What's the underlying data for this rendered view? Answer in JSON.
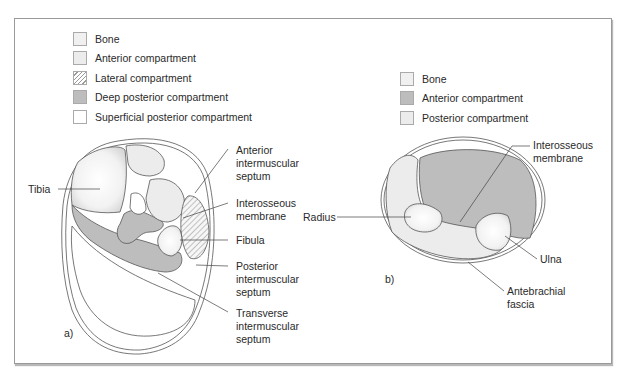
{
  "colors": {
    "bone": "#f4f4f4",
    "light": "#ededed",
    "deep": "#bdbdbd",
    "white": "#ffffff",
    "line": "#555555"
  },
  "panel_a": {
    "legend": [
      {
        "label": "Bone",
        "swatch": "bone"
      },
      {
        "label": "Anterior compartment",
        "swatch": "light"
      },
      {
        "label": "Lateral compartment",
        "swatch": "hatch"
      },
      {
        "label": "Deep posterior compartment",
        "swatch": "deep"
      },
      {
        "label": "Superficial posterior compartment",
        "swatch": "white"
      }
    ],
    "letter": "a)",
    "labels": {
      "tibia": "Tibia",
      "anterior_septum": "Anterior\nintermuscular\nseptum",
      "interosseous": "Interosseous\nmembrane",
      "fibula": "Fibula",
      "posterior_septum": "Posterior\nintermuscular\nseptum",
      "transverse_septum": "Transverse\nintermuscular\nseptum"
    }
  },
  "panel_b": {
    "legend": [
      {
        "label": "Bone",
        "swatch": "bone"
      },
      {
        "label": "Anterior compartment",
        "swatch": "deep"
      },
      {
        "label": "Posterior compartment",
        "swatch": "light"
      }
    ],
    "letter": "b)",
    "labels": {
      "interosseous": "Interosseous\nmembrane",
      "radius": "Radius",
      "ulna": "Ulna",
      "fascia": "Antebrachial\nfascia"
    }
  }
}
